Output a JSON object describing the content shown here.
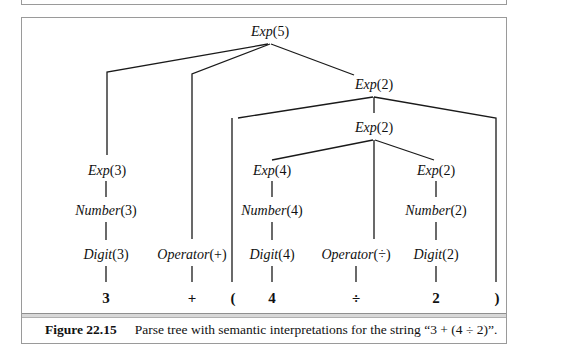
{
  "figure": {
    "number_label": "Figure 22.15",
    "caption": "Parse tree with semantic interpretations for the string “3 + (4 ÷ 2)”."
  },
  "tree": {
    "nodes": [
      {
        "id": "exp5",
        "func": "Exp",
        "arg": "(5)",
        "x": 270,
        "y": 24
      },
      {
        "id": "exp2_outer",
        "func": "Exp",
        "arg": "(2)",
        "x": 374,
        "y": 75
      },
      {
        "id": "exp2_mid",
        "func": "Exp",
        "arg": "(2)",
        "x": 374,
        "y": 117
      },
      {
        "id": "exp3",
        "func": "Exp",
        "arg": "(3)",
        "x": 110,
        "y": 162
      },
      {
        "id": "exp4",
        "func": "Exp",
        "arg": "(4)",
        "x": 272,
        "y": 162
      },
      {
        "id": "exp2_right",
        "func": "Exp",
        "arg": "(2)",
        "x": 436,
        "y": 162
      },
      {
        "id": "number3",
        "func": "Number",
        "arg": "(3)",
        "x": 106,
        "y": 203
      },
      {
        "id": "number4",
        "func": "Number",
        "arg": "(4)",
        "x": 272,
        "y": 203
      },
      {
        "id": "number2",
        "func": "Number",
        "arg": "(2)",
        "x": 436,
        "y": 203
      },
      {
        "id": "digit3",
        "func": "Digit",
        "arg": "(3)",
        "x": 106,
        "y": 247
      },
      {
        "id": "operator_plus",
        "func": "Operator",
        "arg": "(+)",
        "x": 192,
        "y": 247
      },
      {
        "id": "digit4",
        "func": "Digit",
        "arg": "(4)",
        "x": 272,
        "y": 247
      },
      {
        "id": "operator_div",
        "func": "Operator",
        "arg": "(÷)",
        "x": 356,
        "y": 247
      },
      {
        "id": "digit2",
        "func": "Digit",
        "arg": "(2)",
        "x": 436,
        "y": 247
      }
    ],
    "leaves": [
      {
        "id": "leaf3",
        "text": "3",
        "x": 106
      },
      {
        "id": "leafplus",
        "text": "+",
        "x": 192
      },
      {
        "id": "leaflparen",
        "text": "(",
        "x": 233
      },
      {
        "id": "leaf4",
        "text": "4",
        "x": 272
      },
      {
        "id": "leafdiv",
        "text": "÷",
        "x": 356
      },
      {
        "id": "leaf2",
        "text": "2",
        "x": 436
      },
      {
        "id": "leafrparen",
        "text": ")",
        "x": 498
      }
    ],
    "leaf_y": 290,
    "input_string": "3 + (4 ÷ 2)"
  }
}
